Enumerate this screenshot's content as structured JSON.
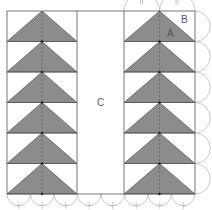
{
  "figure": {
    "labels": {
      "a": "A",
      "b": "B",
      "c": "C"
    },
    "rows": 6,
    "colors": {
      "triangle_fill": "#8c8c8c",
      "outline": "#555555",
      "arc": "#bbbbbb",
      "background": "#ffffff"
    },
    "tick_marks": {
      "top_arcs": "||",
      "bottom_arcs": "+"
    }
  }
}
